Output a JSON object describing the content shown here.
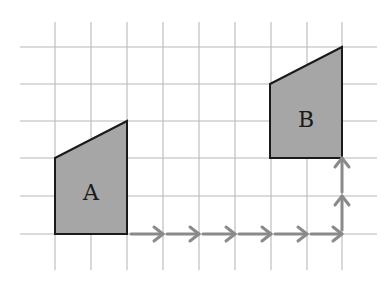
{
  "diagram": {
    "type": "grid-translation",
    "colors": {
      "background": "#ffffff",
      "grid": "#b8b8b8",
      "shape_fill": "#a6a6a6",
      "shape_stroke": "#1a1a1a",
      "arrow": "#8a8a8a",
      "label": "#1a1a1a"
    },
    "grid": {
      "x_lines": [
        55,
        91,
        127,
        163,
        199,
        235,
        271,
        307,
        342
      ],
      "y_lines": [
        47,
        84,
        121,
        158,
        196,
        234
      ],
      "x_extent": [
        20,
        377
      ],
      "y_extent": [
        22,
        270
      ]
    },
    "shapes": [
      {
        "label": "A",
        "points": [
          [
            55,
            158
          ],
          [
            127,
            121
          ],
          [
            127,
            234
          ],
          [
            55,
            234
          ]
        ],
        "label_pos": [
          91,
          194
        ]
      },
      {
        "label": "B",
        "points": [
          [
            270,
            84
          ],
          [
            342,
            47
          ],
          [
            342,
            158
          ],
          [
            270,
            158
          ]
        ],
        "label_pos": [
          306,
          121
        ]
      }
    ],
    "translation": {
      "right_steps": 6,
      "up_steps": 2,
      "arrows": [
        {
          "from": [
            131,
            234
          ],
          "to": [
            163,
            234
          ]
        },
        {
          "from": [
            167,
            234
          ],
          "to": [
            199,
            234
          ]
        },
        {
          "from": [
            203,
            234
          ],
          "to": [
            235,
            234
          ]
        },
        {
          "from": [
            239,
            234
          ],
          "to": [
            271,
            234
          ]
        },
        {
          "from": [
            275,
            234
          ],
          "to": [
            307,
            234
          ]
        },
        {
          "from": [
            311,
            234
          ],
          "to": [
            342,
            234
          ]
        },
        {
          "from": [
            342,
            230
          ],
          "to": [
            342,
            196
          ]
        },
        {
          "from": [
            342,
            192
          ],
          "to": [
            342,
            158
          ]
        }
      ]
    }
  }
}
